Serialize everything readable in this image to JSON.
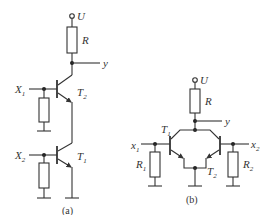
{
  "figure": {
    "a": {
      "caption": "(a)",
      "supply_label": "U",
      "collector_resistor_label": "R",
      "output_label": "y",
      "inputs": [
        {
          "label": "X",
          "sub": "1"
        },
        {
          "label": "X",
          "sub": "2"
        }
      ],
      "transistors": [
        {
          "label": "T",
          "sub": "2"
        },
        {
          "label": "T",
          "sub": "1"
        }
      ]
    },
    "b": {
      "caption": "(b)",
      "supply_label": "U",
      "collector_resistor_label": "R",
      "output_label": "y",
      "inputs": [
        {
          "label": "x",
          "sub": "1"
        },
        {
          "label": "x",
          "sub": "2"
        }
      ],
      "transistors": [
        {
          "label": "T",
          "sub": "1"
        },
        {
          "label": "T",
          "sub": "2"
        }
      ],
      "base_resistors": [
        {
          "label": "R",
          "sub": "1"
        },
        {
          "label": "R",
          "sub": "2"
        }
      ]
    }
  }
}
